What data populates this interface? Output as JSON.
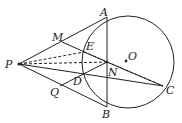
{
  "diagram": {
    "type": "geometry",
    "points": {
      "P": {
        "label": "P",
        "x": 19,
        "y": 64
      },
      "A": {
        "label": "A",
        "x": 107,
        "y": 17
      },
      "B": {
        "label": "B",
        "x": 107,
        "y": 107
      },
      "C": {
        "label": "C",
        "x": 163,
        "y": 86
      },
      "O": {
        "label": "O",
        "x": 126,
        "y": 61
      },
      "N": {
        "label": "N",
        "x": 107,
        "y": 62
      },
      "E": {
        "label": "E",
        "x": 84,
        "y": 52
      },
      "D": {
        "label": "D",
        "x": 84,
        "y": 75
      },
      "M": {
        "label": "M",
        "x": 62,
        "y": 42
      },
      "Q": {
        "label": "Q",
        "x": 60,
        "y": 86
      }
    },
    "circle": {
      "center": "O",
      "cx": 128,
      "cy": 62,
      "r": 46
    }
  }
}
